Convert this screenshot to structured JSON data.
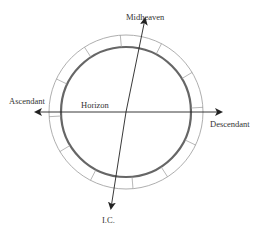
{
  "diagram": {
    "type": "astrological-chart-axes",
    "labels": {
      "midheaven": "Midheaven",
      "ascendant": "Ascendant",
      "descendant": "Descendant",
      "ic": "I.C.",
      "horizon": "Horizon"
    },
    "house_divisions": 12,
    "colors": {
      "ring_outline": "#888888",
      "inner_circle": "#666666",
      "axis": "#222222"
    }
  }
}
